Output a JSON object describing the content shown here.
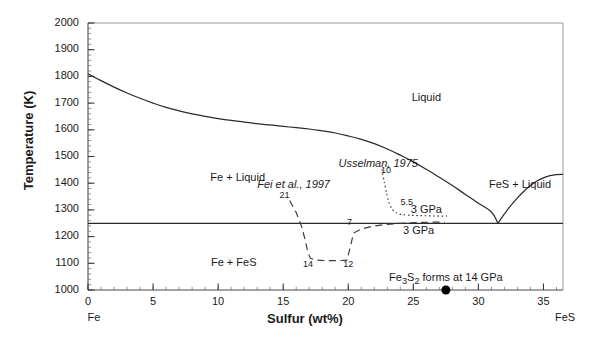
{
  "figure": {
    "background_color": "#ffffff",
    "line_color": "#2b2b2b"
  },
  "axes": {
    "x": {
      "label": "Sulfur (wt%)",
      "min": 0,
      "max": 36.5,
      "ticks": [
        0,
        5,
        10,
        15,
        20,
        25,
        30,
        35
      ],
      "tick_labels": [
        "0",
        "5",
        "10",
        "15",
        "20",
        "25",
        "30",
        "35"
      ],
      "minor_tick_step": 1,
      "left_end_label": "Fe",
      "right_end_label": "FeS"
    },
    "y": {
      "label": "Temperature (K)",
      "min": 1000,
      "max": 2000,
      "ticks": [
        1000,
        1100,
        1200,
        1300,
        1400,
        1500,
        1600,
        1700,
        1800,
        1900,
        2000
      ],
      "tick_labels": [
        "1000",
        "1100",
        "1200",
        "1300",
        "1400",
        "1500",
        "1600",
        "1700",
        "1800",
        "1900",
        "2000"
      ],
      "minor_tick_step": 20
    }
  },
  "regions": [
    {
      "name": "liquid",
      "label": "Liquid",
      "x": 26.0,
      "y": 1718
    },
    {
      "name": "fe-plus-liquid",
      "label": "Fe + Liquid",
      "x": 11.5,
      "y": 1418
    },
    {
      "name": "fe-plus-fes",
      "label": "Fe + FeS",
      "x": 11.2,
      "y": 1098
    },
    {
      "name": "fes-plus-liquid",
      "label": "FeS + Liquid",
      "x": 33.2,
      "y": 1390
    }
  ],
  "annotations": [
    {
      "name": "usselman-source",
      "label": "Usselman, 1975",
      "x": 22.3,
      "y": 1471,
      "style": "italic"
    },
    {
      "name": "fei-source",
      "label": "Fei et al., 1997",
      "x": 15.8,
      "y": 1393,
      "style": "italic"
    },
    {
      "name": "fe3s2-note",
      "label": "Fe3S2 forms at 14 GPa",
      "label_html": "Fe<sub>3</sub>S<sub>2</sub> forms at 14 GPa",
      "x": 27.5,
      "y": 1043
    },
    {
      "name": "usselman-pressure-label",
      "label": "3 GPa",
      "x": 26.0,
      "y": 1297
    },
    {
      "name": "fei-pressure-label",
      "label": "3 GPa",
      "x": 25.4,
      "y": 1218
    }
  ],
  "point_labels": [
    {
      "name": "usselman-10-gpa",
      "label": "10",
      "x": 22.9,
      "y": 1444
    },
    {
      "name": "usselman-5p5-gpa",
      "label": "5.5",
      "x": 24.5,
      "y": 1327
    },
    {
      "name": "fei-21-gpa",
      "label": "21",
      "x": 15.1,
      "y": 1353
    },
    {
      "name": "fei-14-gpa",
      "label": "14",
      "x": 16.9,
      "y": 1094
    },
    {
      "name": "fei-12-gpa",
      "label": "12",
      "x": 20.0,
      "y": 1094
    },
    {
      "name": "fei-7-gpa",
      "label": "7",
      "x": 20.1,
      "y": 1250
    }
  ],
  "markers": [
    {
      "name": "fe3s2-marker",
      "x": 27.5,
      "y": 1000,
      "shape": "filled-circle",
      "color": "#000000",
      "radius": 4.5
    }
  ],
  "chart_data": {
    "type": "line",
    "xlabel": "Sulfur (wt%)",
    "ylabel": "Temperature (K)",
    "xlim": [
      0,
      36.5
    ],
    "ylim": [
      1000,
      2000
    ],
    "grid": false,
    "legend": "none",
    "series": [
      {
        "name": "fe-liquidus-1bar",
        "style": "solid",
        "color": "#2b2b2b",
        "points": [
          [
            0.0,
            1810
          ],
          [
            1.0,
            1784
          ],
          [
            2.0,
            1760
          ],
          [
            3.0,
            1738
          ],
          [
            4.0,
            1718
          ],
          [
            5.0,
            1700
          ],
          [
            6.0,
            1684
          ],
          [
            7.0,
            1671
          ],
          [
            8.0,
            1660
          ],
          [
            9.0,
            1650
          ],
          [
            10.0,
            1642
          ],
          [
            11.0,
            1635
          ],
          [
            12.0,
            1629
          ],
          [
            13.0,
            1623
          ],
          [
            14.0,
            1618
          ],
          [
            15.0,
            1613
          ],
          [
            16.0,
            1608
          ],
          [
            17.0,
            1603
          ],
          [
            18.0,
            1596
          ],
          [
            19.0,
            1588
          ],
          [
            20.0,
            1577
          ],
          [
            21.0,
            1564
          ],
          [
            22.0,
            1548
          ],
          [
            23.0,
            1528
          ],
          [
            24.0,
            1505
          ],
          [
            25.0,
            1480
          ],
          [
            26.0,
            1452
          ],
          [
            27.0,
            1422
          ],
          [
            28.0,
            1391
          ],
          [
            29.0,
            1358
          ],
          [
            30.0,
            1325
          ],
          [
            31.0,
            1292
          ],
          [
            31.5,
            1250
          ]
        ]
      },
      {
        "name": "fes-liquidus-1bar",
        "style": "solid",
        "color": "#2b2b2b",
        "points": [
          [
            31.5,
            1250
          ],
          [
            32.0,
            1285
          ],
          [
            32.5,
            1317
          ],
          [
            33.0,
            1345
          ],
          [
            33.5,
            1370
          ],
          [
            34.0,
            1391
          ],
          [
            34.5,
            1408
          ],
          [
            35.0,
            1420
          ],
          [
            35.5,
            1428
          ],
          [
            36.0,
            1432
          ],
          [
            36.5,
            1433
          ]
        ]
      },
      {
        "name": "eutectic-isotherm-1bar",
        "style": "solid",
        "color": "#2b2b2b",
        "points": [
          [
            0.0,
            1250
          ],
          [
            36.5,
            1250
          ]
        ]
      },
      {
        "name": "usselman-high-pressure-eutectic",
        "style": "dotted",
        "color": "#3a3a3a",
        "points": [
          [
            22.6,
            1452
          ],
          [
            22.7,
            1420
          ],
          [
            22.85,
            1385
          ],
          [
            23.0,
            1350
          ],
          [
            23.2,
            1318
          ],
          [
            23.5,
            1296
          ],
          [
            23.9,
            1285
          ],
          [
            24.5,
            1281
          ],
          [
            25.2,
            1279
          ],
          [
            26.0,
            1278
          ],
          [
            26.8,
            1277
          ],
          [
            27.6,
            1277
          ]
        ]
      },
      {
        "name": "fei-high-pressure-eutectic",
        "style": "dashed",
        "color": "#3a3a3a",
        "points": [
          [
            15.5,
            1335
          ],
          [
            16.0,
            1290
          ],
          [
            16.4,
            1240
          ],
          [
            16.7,
            1185
          ],
          [
            16.9,
            1140
          ],
          [
            17.1,
            1118
          ],
          [
            17.6,
            1112
          ],
          [
            18.4,
            1110
          ],
          [
            19.2,
            1110
          ],
          [
            19.9,
            1112
          ],
          [
            20.2,
            1170
          ],
          [
            20.4,
            1213
          ],
          [
            21.0,
            1228
          ],
          [
            21.8,
            1238
          ],
          [
            22.8,
            1245
          ],
          [
            24.0,
            1250
          ],
          [
            25.2,
            1253
          ],
          [
            26.4,
            1254
          ],
          [
            27.4,
            1254
          ]
        ]
      }
    ]
  }
}
